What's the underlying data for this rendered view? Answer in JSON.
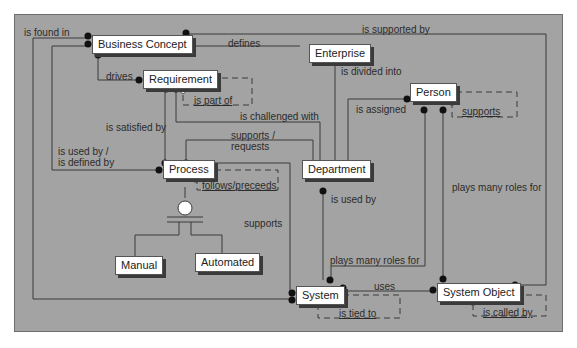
{
  "diagram": {
    "background_color": "#a3a3a3",
    "entity_fill": "#ffffff",
    "line_color": "#3a3a3a",
    "entities": [
      {
        "id": "business_concept",
        "label": "Business Concept"
      },
      {
        "id": "enterprise",
        "label": "Enterprise"
      },
      {
        "id": "requirement",
        "label": "Requirement"
      },
      {
        "id": "person",
        "label": "Person"
      },
      {
        "id": "process",
        "label": "Process"
      },
      {
        "id": "department",
        "label": "Department"
      },
      {
        "id": "manual",
        "label": "Manual"
      },
      {
        "id": "automated",
        "label": "Automated"
      },
      {
        "id": "system",
        "label": "System"
      },
      {
        "id": "system_object",
        "label": "System Object"
      }
    ],
    "relationships": [
      {
        "label": "is found in",
        "from": "Business Concept",
        "to": "System"
      },
      {
        "label": "defines",
        "from": "Business Concept",
        "to": "Enterprise"
      },
      {
        "label": "is supported by",
        "from": "Business Concept",
        "to": "System Object"
      },
      {
        "label": "drives",
        "from": "Business Concept",
        "to": "Requirement"
      },
      {
        "label": "is part of",
        "from": "Requirement",
        "to": "Requirement",
        "style": "dashed-recursive"
      },
      {
        "label": "is divided into",
        "from": "Enterprise",
        "to": "Department"
      },
      {
        "label": "is challenged with",
        "from": "Requirement",
        "to": "Department"
      },
      {
        "label": "is satisfied by",
        "from": "Requirement",
        "to": "Process"
      },
      {
        "label": "is assigned",
        "from": "Person",
        "to": "Department"
      },
      {
        "label": "supports",
        "from": "Person",
        "to": "Person",
        "style": "dashed-recursive"
      },
      {
        "label": "supports / requests",
        "from": "Process",
        "to": "Department"
      },
      {
        "label": "is used by / is defined by",
        "from": "Business Concept",
        "to": "Process"
      },
      {
        "label": "follows/preceeds",
        "from": "Process",
        "to": "Process",
        "style": "dashed-recursive"
      },
      {
        "label": "supports",
        "from": "Process",
        "to": "System"
      },
      {
        "label": "is used by",
        "from": "Department",
        "to": "System"
      },
      {
        "label": "plays many roles for",
        "from": "Person",
        "to": "System"
      },
      {
        "label": "plays many roles for",
        "from": "Person",
        "to": "System Object"
      },
      {
        "label": "uses",
        "from": "System",
        "to": "System Object"
      },
      {
        "label": "is tied to",
        "from": "System",
        "to": "System",
        "style": "dashed-recursive"
      },
      {
        "label": "is called by",
        "from": "System Object",
        "to": "System Object",
        "style": "dashed-recursive"
      }
    ],
    "subtypes": {
      "parent": "Process",
      "children": [
        "Manual",
        "Automated"
      ]
    },
    "labels": {
      "is_found_in": "is found in",
      "defines": "defines",
      "is_supported_by": "is supported by",
      "drives": "drives",
      "is_part_of": "is part of",
      "is_divided_into": "is divided into",
      "is_challenged_with": "is challenged with",
      "is_satisfied_by": "is satisfied by",
      "is_assigned": "is assigned",
      "supports_person": "supports",
      "supports_requests_1": "supports /",
      "supports_requests_2": "requests",
      "is_used_by_1": "is used by /",
      "is_used_by_2": "is defined by",
      "follows_preceeds": "follows/preceeds",
      "supports_system": "supports",
      "is_used_by_dept": "is used by",
      "plays_roles_system": "plays many roles for",
      "plays_roles_object": "plays many roles for",
      "uses": "uses",
      "is_tied_to": "is tied to",
      "is_called_by": "is called by"
    }
  }
}
